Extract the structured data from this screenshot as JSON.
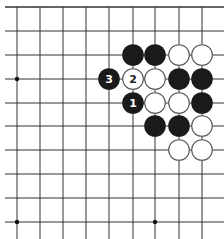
{
  "board": {
    "grid": {
      "x": [
        17,
        40,
        63,
        86,
        109,
        133,
        155,
        179,
        202
      ],
      "y": [
        7,
        31,
        55,
        79,
        103,
        126,
        150,
        174,
        198,
        222
      ],
      "x_extent": [
        5,
        224
      ],
      "y_extent": [
        7,
        239
      ],
      "line_color": "#333333",
      "top_edge": true
    },
    "star_points": [
      {
        "col": 0,
        "row": 3
      },
      {
        "col": 0,
        "row": 9
      },
      {
        "col": 6,
        "row": 9
      }
    ],
    "colors": {
      "black_stone": "#1a1a1a",
      "white_stone": "#ffffff",
      "white_stroke": "#555555",
      "label_on_black": "#ffffff",
      "label_on_white": "#222222"
    },
    "stones": [
      {
        "col": 5,
        "row": 2,
        "color": "black",
        "label": ""
      },
      {
        "col": 6,
        "row": 2,
        "color": "black",
        "label": ""
      },
      {
        "col": 7,
        "row": 2,
        "color": "white",
        "label": ""
      },
      {
        "col": 8,
        "row": 2,
        "color": "white",
        "label": ""
      },
      {
        "col": 4,
        "row": 3,
        "color": "black",
        "label": "3"
      },
      {
        "col": 5,
        "row": 3,
        "color": "white",
        "label": "2"
      },
      {
        "col": 6,
        "row": 3,
        "color": "white",
        "label": ""
      },
      {
        "col": 7,
        "row": 3,
        "color": "black",
        "label": ""
      },
      {
        "col": 8,
        "row": 3,
        "color": "black",
        "label": ""
      },
      {
        "col": 5,
        "row": 4,
        "color": "black",
        "label": "1"
      },
      {
        "col": 6,
        "row": 4,
        "color": "white",
        "label": ""
      },
      {
        "col": 7,
        "row": 4,
        "color": "white",
        "label": ""
      },
      {
        "col": 8,
        "row": 4,
        "color": "black",
        "label": ""
      },
      {
        "col": 6,
        "row": 5,
        "color": "black",
        "label": ""
      },
      {
        "col": 7,
        "row": 5,
        "color": "black",
        "label": ""
      },
      {
        "col": 8,
        "row": 5,
        "color": "white",
        "label": ""
      },
      {
        "col": 7,
        "row": 6,
        "color": "white",
        "label": ""
      },
      {
        "col": 8,
        "row": 6,
        "color": "white",
        "label": ""
      }
    ]
  }
}
